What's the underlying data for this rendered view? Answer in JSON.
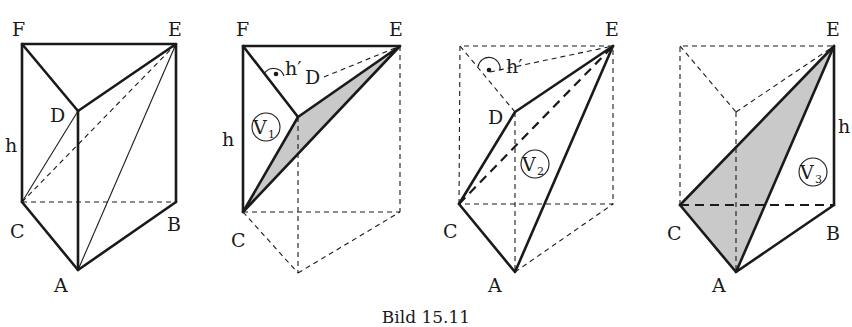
{
  "caption": "Bild 15.11",
  "figures": [
    {
      "id": "prism",
      "vertices": {
        "F": "F",
        "E": "E",
        "D": "D",
        "C": "C",
        "B": "B",
        "A": "A"
      },
      "height_label": "h"
    },
    {
      "id": "pyramid-v1",
      "vertices": {
        "F": "F",
        "E": "E",
        "D": "D",
        "C": "C"
      },
      "height_label": "h",
      "altitude_label": "h′",
      "volume_label": "V",
      "volume_index": "1"
    },
    {
      "id": "pyramid-v2",
      "vertices": {
        "E": "E",
        "D": "D",
        "C": "C",
        "A": "A"
      },
      "altitude_label": "h′",
      "volume_label": "V",
      "volume_index": "2"
    },
    {
      "id": "pyramid-v3",
      "vertices": {
        "E": "E",
        "C": "C",
        "B": "B",
        "A": "A"
      },
      "height_label": "h",
      "volume_label": "V",
      "volume_index": "3"
    }
  ],
  "colors": {
    "line": "#1a1a1a",
    "shade": "#c9c9c9",
    "background": "#ffffff"
  }
}
